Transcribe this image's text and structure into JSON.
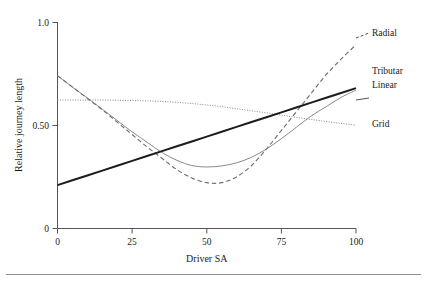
{
  "chart_data": {
    "type": "line",
    "title": "",
    "xlabel": "Driver SA",
    "ylabel": "Relative journey length",
    "xlim": [
      0,
      100
    ],
    "ylim": [
      0,
      1.0
    ],
    "xticks": [
      0,
      25,
      50,
      75,
      100
    ],
    "xtick_labels": [
      "0",
      "25",
      "50",
      "75",
      "100"
    ],
    "yticks": [
      0,
      0.5,
      1.0
    ],
    "ytick_labels": [
      "0",
      "0.50",
      "1.0"
    ],
    "grid": false,
    "legend_position": "right-inline-labels",
    "x": [
      0,
      5,
      10,
      15,
      20,
      25,
      30,
      35,
      40,
      45,
      50,
      55,
      60,
      65,
      70,
      75,
      80,
      85,
      90,
      95,
      100
    ],
    "series": [
      {
        "name": "Radial",
        "style": "dashed",
        "color": "#6e6e6e",
        "values": [
          0.74,
          0.685,
          0.63,
          0.575,
          0.515,
          0.455,
          0.395,
          0.34,
          0.285,
          0.245,
          0.222,
          0.222,
          0.25,
          0.305,
          0.385,
          0.475,
          0.565,
          0.655,
          0.745,
          0.82,
          0.89
        ]
      },
      {
        "name": "Tributary",
        "style": "solid-thin",
        "color": "#8a8a8a",
        "values": [
          0.74,
          0.685,
          0.632,
          0.578,
          0.523,
          0.468,
          0.418,
          0.368,
          0.33,
          0.305,
          0.298,
          0.303,
          0.318,
          0.345,
          0.385,
          0.435,
          0.49,
          0.545,
          0.59,
          0.635,
          0.67
        ]
      },
      {
        "name": "Linear",
        "style": "solid-thick",
        "color": "#1c1c1c",
        "values": [
          0.21,
          0.2335,
          0.257,
          0.2805,
          0.304,
          0.3275,
          0.351,
          0.3745,
          0.398,
          0.4215,
          0.445,
          0.4685,
          0.492,
          0.5155,
          0.539,
          0.5625,
          0.586,
          0.6095,
          0.633,
          0.6565,
          0.68
        ]
      },
      {
        "name": "Grid",
        "style": "dotted",
        "color": "#7a7a7a",
        "values": [
          0.622,
          0.622,
          0.622,
          0.622,
          0.621,
          0.62,
          0.618,
          0.615,
          0.611,
          0.605,
          0.598,
          0.59,
          0.58,
          0.57,
          0.56,
          0.549,
          0.538,
          0.528,
          0.518,
          0.509,
          0.5
        ]
      }
    ],
    "annotations": [
      {
        "label": "Radial",
        "x": 100,
        "y": 0.89
      },
      {
        "label": "Tributar",
        "x": 100,
        "y": 0.7
      },
      {
        "label": "Linear",
        "x": 100,
        "y": 0.645
      },
      {
        "label": "Grid",
        "x": 100,
        "y": 0.5
      }
    ]
  },
  "axes": {
    "x_title": "Driver SA",
    "y_title": "Relative journey length",
    "x_tick_labels": [
      "0",
      "25",
      "50",
      "75",
      "100"
    ],
    "y_tick_labels": [
      "0",
      "0.50",
      "1.0"
    ]
  },
  "legend": {
    "radial": "Radial",
    "tributary": "Tributar",
    "linear": "Linear",
    "grid": "Grid"
  }
}
